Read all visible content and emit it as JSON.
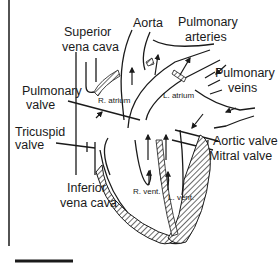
{
  "diagram": {
    "labels": {
      "superior_vena_cava": [
        "Superior",
        "vena cava"
      ],
      "aorta": "Aorta",
      "pulmonary_arteries": [
        "Pulmonary",
        "arteries"
      ],
      "pulmonary_veins": [
        "Pulmonary",
        "veins"
      ],
      "pulmonary_valve": [
        "Pulmonary",
        "valve"
      ],
      "tricuspid_valve": [
        "Tricuspid",
        "valve"
      ],
      "aortic_valve": "Aortic valve",
      "mitral_valve": "Mitral valve",
      "inferior_vena_cava": [
        "Inferior",
        "vena cava"
      ]
    },
    "chambers": {
      "right_atrium": "R. atrium",
      "left_atrium": "L. atrium",
      "right_ventricle": "R. vent.",
      "left_ventricle": "L. vent."
    },
    "colors": {
      "ink": "#1a1a1a",
      "background": "#ffffff"
    }
  }
}
